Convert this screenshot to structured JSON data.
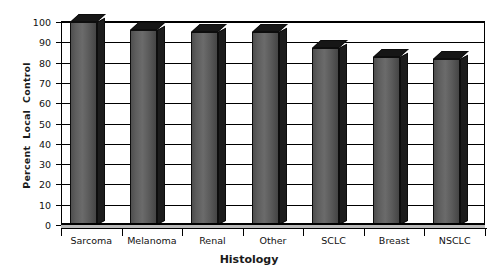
{
  "chart_data": {
    "type": "bar",
    "title": "",
    "subtitle": "",
    "xlabel": "Histology",
    "ylabel": "Percent  Local  Control",
    "categories": [
      "Sarcoma",
      "Melanoma",
      "Renal",
      "Other",
      "SCLC",
      "Breast",
      "NSCLC"
    ],
    "values": [
      100,
      96,
      95,
      95,
      87,
      83,
      82
    ],
    "series": [
      {
        "name": "Percent Local Control",
        "values": [
          100,
          96,
          95,
          95,
          87,
          83,
          82
        ]
      }
    ],
    "ylim": [
      0,
      100
    ],
    "ytick_labels": [
      "0",
      "10",
      "20",
      "30",
      "40",
      "50",
      "60",
      "70",
      "80",
      "90",
      "100"
    ],
    "ytick_values": [
      0,
      10,
      20,
      30,
      40,
      50,
      60,
      70,
      80,
      90,
      100
    ],
    "ytick_interval": 10,
    "grid": true,
    "grid_axis": "y",
    "legend": false,
    "legend_position": "none",
    "style": "3d-bar-grayscale",
    "bar_color": "#5d5d5d",
    "bar_top_color": "#161616",
    "bar_side_color": "#1c1c1c",
    "background_color": "#ffffff",
    "axis_color": "#000000",
    "annotations": []
  }
}
